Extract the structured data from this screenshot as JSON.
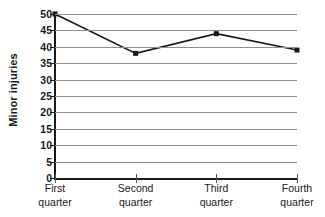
{
  "chart_data": {
    "type": "line",
    "title": "",
    "xlabel": "",
    "ylabel": "Minor injuries",
    "categories": [
      "First quarter",
      "Second quarter",
      "Third quarter",
      "Fourth quarter"
    ],
    "category_lines": [
      [
        "First",
        "quarter"
      ],
      [
        "Second",
        "quarter"
      ],
      [
        "Third",
        "quarter"
      ],
      [
        "Fourth",
        "quarter"
      ]
    ],
    "values": [
      50,
      38,
      44,
      39
    ],
    "ylim": [
      0,
      50
    ],
    "ytick_step": 5,
    "ytick_labels": [
      "0",
      "5",
      "10",
      "15",
      "20",
      "25",
      "30",
      "35",
      "40",
      "45",
      "50"
    ],
    "ytick_values": [
      0,
      5,
      10,
      15,
      20,
      25,
      30,
      35,
      40,
      45,
      50
    ],
    "grid": true,
    "grid_axis": "y",
    "legend": false,
    "marker": "square",
    "series_color": "#1a1a1a",
    "grid_color": "#8e8e8e",
    "axis_color": "#1a1a1a",
    "background_color": "#ffffff"
  }
}
